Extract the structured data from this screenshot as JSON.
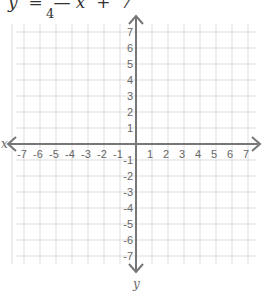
{
  "problem": {
    "equation_visible": "y  =  — x  +  7",
    "equation_numerator_hidden": true,
    "equation_denominator": "4",
    "equation_prefix_cropped": "·"
  },
  "graph": {
    "type": "coordinate-plane",
    "x_axis_label": "x",
    "y_axis_label": "y",
    "x_range": [
      -7,
      7
    ],
    "y_range": [
      -7,
      7
    ],
    "x_ticks": [
      "-7",
      "-6",
      "-5",
      "-4",
      "-3",
      "-2",
      "-1",
      "1",
      "2",
      "3",
      "4",
      "5",
      "6",
      "7"
    ],
    "y_ticks": [
      "7",
      "6",
      "5",
      "4",
      "3",
      "2",
      "1",
      "-1",
      "-2",
      "-3",
      "-4",
      "-5",
      "-6",
      "-7"
    ],
    "grid_spacing_px": 16,
    "origin_px": [
      136,
      144
    ],
    "colors": {
      "grid": "#dddddd",
      "axis": "#777777",
      "text": "#666666"
    }
  }
}
